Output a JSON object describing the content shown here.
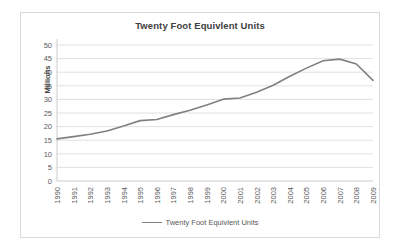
{
  "chart_data": {
    "type": "line",
    "title": "Twenty Foot Equivlent Units",
    "xlabel": "",
    "ylabel": "Millions",
    "ylim": [
      0,
      50
    ],
    "ytick_step": 5,
    "yticks": [
      0,
      5,
      10,
      15,
      20,
      25,
      30,
      35,
      40,
      45,
      50
    ],
    "grid": true,
    "legend_position": "bottom",
    "line_color": "#808080",
    "categories": [
      "1990",
      "1991",
      "1992",
      "1993",
      "1994",
      "1995",
      "1996",
      "1997",
      "1998",
      "1999",
      "2000",
      "2001",
      "2002",
      "2003",
      "2004",
      "2005",
      "2006",
      "2007",
      "2008",
      "2009"
    ],
    "series": [
      {
        "name": "Twenty Foot Equivlent Units",
        "values": [
          15.5,
          16.3,
          17.2,
          18.4,
          20.2,
          22.2,
          22.6,
          24.4,
          26.0,
          27.9,
          30.1,
          30.5,
          32.6,
          35.2,
          38.5,
          41.5,
          44.2,
          44.8,
          43.0,
          37.0
        ]
      }
    ]
  },
  "legend": {
    "entries": [
      {
        "label": "Twenty Foot Equivlent Units"
      }
    ]
  }
}
